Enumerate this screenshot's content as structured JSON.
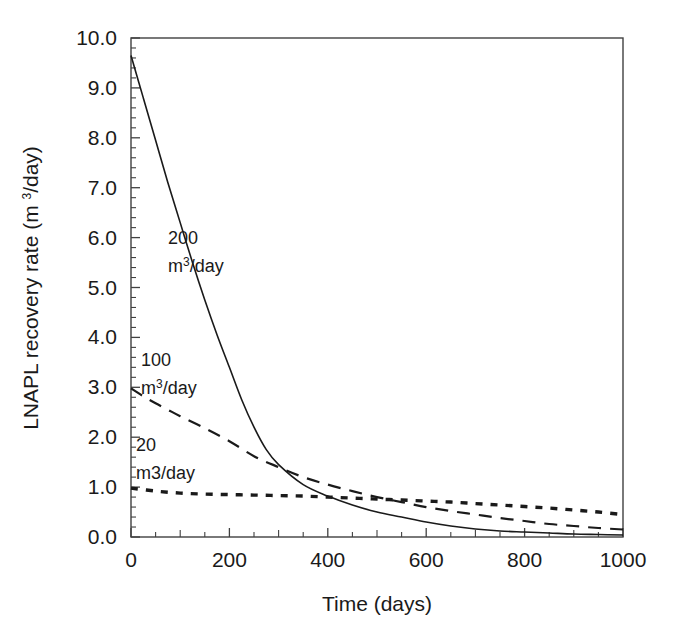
{
  "figure": {
    "background_color": "#ffffff",
    "line_color": "#1a1a1a",
    "axis_color": "#404040"
  },
  "axes": {
    "x_title": "Time (days)",
    "y_title_parts": {
      "before": "LNAPL recovery rate (m ",
      "superscript": "3",
      "after": "/day)"
    },
    "y_title_plain": "LNAPL recovery rate (m 3/day)",
    "x_ticklabels": [
      "0",
      "200",
      "400",
      "600",
      "800",
      "1000"
    ],
    "y_ticklabels": [
      "0.0",
      "1.0",
      "2.0",
      "3.0",
      "4.0",
      "5.0",
      "6.0",
      "7.0",
      "8.0",
      "9.0",
      "10.0"
    ]
  },
  "annotations": [
    {
      "id": "series-200",
      "value_label": "200",
      "unit_label_before": "m",
      "unit_label_superscript": "3",
      "unit_label_after": "/day",
      "unit_label_plain": "m3/day",
      "x_px": 168,
      "y_px": 244
    },
    {
      "id": "series-100",
      "value_label": "100",
      "unit_label_before": "m",
      "unit_label_superscript": "3",
      "unit_label_after": "/day",
      "unit_label_plain": "m3/day",
      "x_px": 141,
      "y_px": 366
    },
    {
      "id": "series-20",
      "value_label": "20",
      "unit_label_before": "m3/day",
      "unit_label_superscript": "",
      "unit_label_after": "",
      "unit_label_plain": "m3/day",
      "x_px": 136,
      "y_px": 451
    }
  ],
  "chart_data": {
    "type": "line",
    "title": "",
    "xlabel": "Time (days)",
    "ylabel": "LNAPL recovery rate (m3/day)",
    "xlim": [
      0,
      1000
    ],
    "ylim": [
      0,
      10
    ],
    "xticks": [
      0,
      200,
      400,
      600,
      800,
      1000
    ],
    "yticks": [
      0,
      1,
      2,
      3,
      4,
      5,
      6,
      7,
      8,
      9,
      10
    ],
    "x_minor_tick_interval": 50,
    "y_minor_tick_interval": 0.2,
    "grid": false,
    "legend": "inline-annotations",
    "series": [
      {
        "name": "200 m3/day",
        "style": "solid",
        "x": [
          0,
          25,
          50,
          75,
          100,
          125,
          150,
          175,
          200,
          225,
          250,
          275,
          300,
          350,
          400,
          450,
          500,
          550,
          600,
          650,
          700,
          750,
          800,
          850,
          900,
          950,
          1000
        ],
        "values": [
          9.65,
          8.8,
          7.95,
          7.1,
          6.3,
          5.5,
          4.75,
          4.05,
          3.4,
          2.75,
          2.2,
          1.75,
          1.45,
          1.05,
          0.82,
          0.64,
          0.5,
          0.4,
          0.3,
          0.22,
          0.16,
          0.12,
          0.1,
          0.08,
          0.06,
          0.05,
          0.04
        ]
      },
      {
        "name": "100 m3/day",
        "style": "dashed",
        "x": [
          0,
          25,
          50,
          75,
          100,
          150,
          200,
          250,
          300,
          350,
          400,
          450,
          500,
          550,
          600,
          650,
          700,
          750,
          800,
          850,
          900,
          950,
          1000
        ],
        "values": [
          2.98,
          2.82,
          2.68,
          2.55,
          2.42,
          2.18,
          1.92,
          1.62,
          1.4,
          1.2,
          1.05,
          0.92,
          0.8,
          0.7,
          0.6,
          0.52,
          0.45,
          0.38,
          0.32,
          0.26,
          0.22,
          0.18,
          0.15
        ]
      },
      {
        "name": "20 m3/day",
        "style": "dotted",
        "x": [
          0,
          50,
          100,
          150,
          200,
          250,
          300,
          350,
          400,
          450,
          500,
          550,
          600,
          650,
          700,
          750,
          800,
          850,
          900,
          950,
          1000
        ],
        "values": [
          0.98,
          0.92,
          0.88,
          0.86,
          0.85,
          0.84,
          0.83,
          0.82,
          0.8,
          0.78,
          0.76,
          0.74,
          0.72,
          0.7,
          0.67,
          0.64,
          0.61,
          0.58,
          0.54,
          0.5,
          0.45
        ]
      }
    ]
  }
}
